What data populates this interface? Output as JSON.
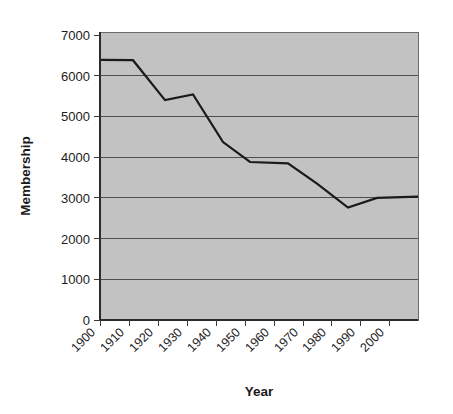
{
  "chart_data": {
    "type": "line",
    "title": "",
    "xlabel": "Year",
    "ylabel": "Membership",
    "categories": [
      "1900",
      "1910",
      "1920",
      "1930",
      "1940",
      "1950",
      "1960",
      "1970",
      "1980",
      "1990",
      "2000"
    ],
    "x": [
      1900,
      1910,
      1920,
      1930,
      1940,
      1950,
      1960,
      1970,
      1980,
      1990,
      2000
    ],
    "values": [
      6390,
      6380,
      5400,
      5540,
      4370,
      3880,
      3850,
      3350,
      2760,
      3000,
      3030
    ],
    "series": [
      {
        "name": "Membership",
        "values": [
          6390,
          6380,
          5400,
          5540,
          4370,
          3880,
          3850,
          3350,
          2760,
          3000,
          3030
        ]
      }
    ],
    "xlim": [
      1900,
      2000
    ],
    "ylim": [
      0,
      7000
    ],
    "ytick_labels": [
      "0",
      "1000",
      "2000",
      "3000",
      "4000",
      "5000",
      "6000",
      "7000"
    ],
    "yticks": [
      0,
      1000,
      2000,
      3000,
      4000,
      5000,
      6000,
      7000
    ],
    "grid": true,
    "grid_axis": "y",
    "legend": false,
    "legend_position": "none",
    "line_color": "#1a1a1a",
    "plot_background": "#c2c2c2",
    "figure_background": "#ffffff",
    "gridline_color": "#4f4f4f",
    "xtick_rotation": "45"
  },
  "axes": {
    "y_label": "Membership",
    "x_label": "Year",
    "y_ticks": [
      {
        "label": "7000"
      },
      {
        "label": "6000"
      },
      {
        "label": "5000"
      },
      {
        "label": "4000"
      },
      {
        "label": "3000"
      },
      {
        "label": "2000"
      },
      {
        "label": "1000"
      },
      {
        "label": "0"
      }
    ],
    "x_ticks": [
      {
        "label": "1900"
      },
      {
        "label": "1910"
      },
      {
        "label": "1920"
      },
      {
        "label": "1930"
      },
      {
        "label": "1940"
      },
      {
        "label": "1950"
      },
      {
        "label": "1960"
      },
      {
        "label": "1970"
      },
      {
        "label": "1980"
      },
      {
        "label": "1990"
      },
      {
        "label": "2000"
      }
    ]
  }
}
